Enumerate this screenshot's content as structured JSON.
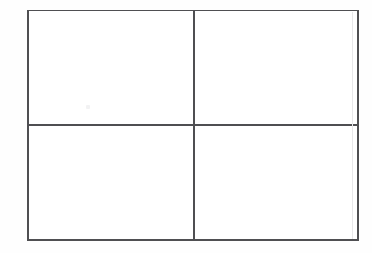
{
  "document": {
    "kind": "scanned-line-drawing",
    "title": "",
    "background_color": "#fefefe",
    "page_color": "#ffffff"
  },
  "grid": {
    "name": "two-by-two-grid",
    "rows": 2,
    "columns": 2,
    "line_color": "#4f4f52",
    "ghost_line_color": "#e7e7e9",
    "frame": {
      "left": 27,
      "top": 10,
      "width": 331,
      "height": 230
    },
    "borders": [
      {
        "name": "border-top",
        "orientation": "horizontal",
        "position": 10
      },
      {
        "name": "border-bottom",
        "orientation": "horizontal",
        "position": 239
      },
      {
        "name": "border-left",
        "orientation": "vertical",
        "position": 27
      },
      {
        "name": "border-right",
        "orientation": "vertical",
        "position": 357
      }
    ],
    "dividers": [
      {
        "name": "divider-horizontal",
        "orientation": "horizontal",
        "position": 124
      },
      {
        "name": "divider-vertical",
        "orientation": "vertical",
        "position": 193
      }
    ],
    "cells": [
      {
        "name": "cell-top-left",
        "row": 1,
        "column": 1,
        "text": ""
      },
      {
        "name": "cell-top-right",
        "row": 1,
        "column": 2,
        "text": ""
      },
      {
        "name": "cell-bottom-left",
        "row": 2,
        "column": 1,
        "text": ""
      },
      {
        "name": "cell-bottom-right",
        "row": 2,
        "column": 2,
        "text": ""
      }
    ]
  },
  "artifacts": {
    "speck": {
      "name": "faint-speck",
      "x": 86,
      "y": 105,
      "color": "#f2f2f3"
    }
  }
}
